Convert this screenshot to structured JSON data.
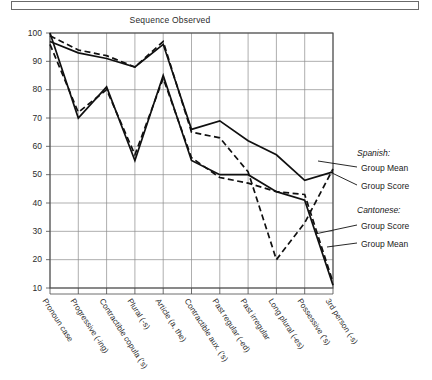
{
  "chart_data": {
    "type": "line",
    "title": "Sequence Observed",
    "xlabel": "",
    "ylabel": "",
    "ylim": [
      10,
      100
    ],
    "yticks": [
      10,
      20,
      30,
      40,
      50,
      60,
      70,
      80,
      90,
      100
    ],
    "grid": true,
    "legend_position": "right",
    "categories": [
      "Pronoun case",
      "Progressive (-ing)",
      "Contractible copula ('s)",
      "Plural (-s)",
      "Article (a, the)",
      "Contractible aux. ('s)",
      "Past regular (-ed)",
      "Past irregular",
      "Long plural (-es)",
      "Possessive ('s)",
      "3rd person (-s)"
    ],
    "series": [
      {
        "name": "Cantonese Group Mean",
        "style": "dashed",
        "values": [
          99,
          94,
          92,
          88,
          97,
          65,
          63,
          51,
          20,
          33,
          52
        ]
      },
      {
        "name": "Cantonese Group Score",
        "style": "solid",
        "values": [
          97,
          93,
          91,
          88,
          96,
          66,
          69,
          62,
          57,
          48,
          51
        ]
      },
      {
        "name": "Spanish Group Score",
        "style": "dashed",
        "values": [
          96,
          72,
          80,
          57,
          84,
          56,
          49,
          47,
          44,
          43,
          12
        ]
      },
      {
        "name": "Spanish Group Mean",
        "style": "solid",
        "values": [
          100,
          70,
          81,
          55,
          85,
          55,
          50,
          50,
          44,
          41,
          11
        ]
      }
    ]
  },
  "legend": {
    "spanish_header": "Spanish:",
    "spanish_items": [
      "Group Mean",
      "Group Score"
    ],
    "cantonese_header": "Cantonese:",
    "cantonese_items": [
      "Group Score",
      "Group Mean"
    ]
  }
}
